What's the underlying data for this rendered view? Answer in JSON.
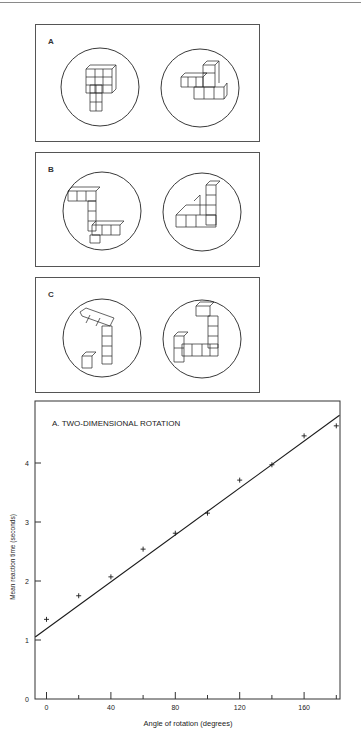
{
  "figure": {
    "panels": [
      {
        "label": "A",
        "description": "Pair of 3-D cube-block figures differing by rotation in depth"
      },
      {
        "label": "B",
        "description": "Pair of 3-D cube-block figures differing by rotation in picture plane"
      },
      {
        "label": "C",
        "description": "Pair of 3-D cube-block figures that are mirror images"
      }
    ]
  },
  "chart_data": {
    "type": "scatter",
    "title": "A. TWO-DIMENSIONAL ROTATION",
    "xlabel": "Angle of rotation (degrees)",
    "ylabel": "Mean reaction time (seconds)",
    "xlim": [
      -7,
      182
    ],
    "ylim": [
      0,
      5.05
    ],
    "x_ticks_labeled": [
      0,
      40,
      80,
      120,
      160
    ],
    "x_ticks_minor": [
      20,
      60,
      100,
      140,
      180
    ],
    "y_ticks": [
      0,
      1,
      2,
      3,
      4
    ],
    "grid": false,
    "series": [
      {
        "name": "observed",
        "marker": "plus",
        "x": [
          0,
          20,
          40,
          60,
          80,
          100,
          120,
          140,
          160,
          180
        ],
        "y": [
          1.35,
          1.75,
          2.07,
          2.54,
          2.81,
          3.15,
          3.71,
          3.97,
          4.46,
          4.63
        ]
      },
      {
        "name": "fit",
        "type": "line",
        "x": [
          -7,
          182
        ],
        "y": [
          1.05,
          4.81
        ]
      }
    ]
  }
}
